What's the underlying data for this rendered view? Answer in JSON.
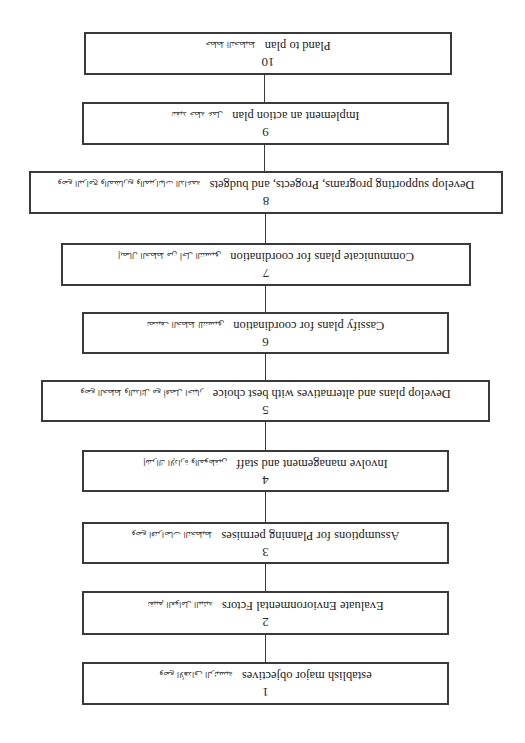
{
  "diagram": {
    "type": "vertical-flowchart",
    "orientation": "rotated-180",
    "border_color": "#3a3a3a",
    "steps": [
      {
        "number": "1",
        "label": "establish major objectives",
        "arabic": "وضع الأهداف الرئيسية"
      },
      {
        "number": "2",
        "label": "Evaluate Envioronmental Fctors",
        "arabic": "تقييم العوامل البيئية"
      },
      {
        "number": "3",
        "label": "Assumptions for Planning permises",
        "arabic": "وضع افتراضات التخطيط"
      },
      {
        "number": "4",
        "label": "Involve management and staff",
        "arabic": "إشراك الإدارة والموظفين"
      },
      {
        "number": "5",
        "label": "Develop plans and alternatives with best choice",
        "arabic": "وضع الخطط والبدائل مع أفضل اختيار"
      },
      {
        "number": "6",
        "label": "Cassify plans for coordination",
        "arabic": "تصنيف الخطط للتنسيق"
      },
      {
        "number": "7",
        "label": "Communicate plans for coordination",
        "arabic": "إيصال الخطط من أجل التنسيق"
      },
      {
        "number": "8",
        "label": "Develop supporting programs, Progects, and budgets",
        "arabic": "وضع البرامج والمشاريع والميزانيات الداعمة"
      },
      {
        "number": "9",
        "label": "Implement an action plan",
        "arabic": "تنفيذ خطة عمل"
      },
      {
        "number": "10",
        "label": "Pland to plan",
        "arabic": "خطط التخطيط"
      }
    ]
  }
}
